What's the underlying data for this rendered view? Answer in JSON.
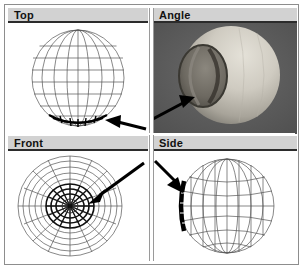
{
  "window": {
    "title": "3D Modeler Four-View Layout",
    "background_color": "#ffffff",
    "frame_color": "#8d8d8d"
  },
  "viewports": [
    {
      "id": "top",
      "label": "Top",
      "position": "top-left",
      "render_mode": "wireframe",
      "object": "sphere",
      "background_color": "#ffffff",
      "wire_color": "#555555",
      "highlight_color": "#000000",
      "highlight_description": "bold dark polar cap at bottom of sphere",
      "annotation": {
        "type": "arrow",
        "direction": "points-left",
        "from": "right",
        "target": "bottom-cap-of-sphere",
        "color": "#000000"
      }
    },
    {
      "id": "angle",
      "label": "Angle",
      "position": "top-right",
      "render_mode": "shaded",
      "object": "sphere-with-crater",
      "background_color": "#5a5a5a",
      "sphere_color": "#c9c6bd",
      "crater_color": "#6e6a63",
      "annotation": {
        "type": "arrow",
        "direction": "points-upper-right",
        "from": "lower-left",
        "target": "crater-rim",
        "color": "#000000"
      }
    },
    {
      "id": "front",
      "label": "Front",
      "position": "bottom-left",
      "render_mode": "wireframe",
      "object": "sphere-polar-view",
      "background_color": "#ffffff",
      "wire_color": "#555555",
      "highlight_color": "#000000",
      "highlight_description": "dense dark concentric rings and radial spokes at center",
      "annotation": {
        "type": "arrow",
        "direction": "points-lower-left",
        "from": "upper-right",
        "target": "center-hub",
        "color": "#000000"
      }
    },
    {
      "id": "side",
      "label": "Side",
      "position": "bottom-right",
      "render_mode": "wireframe",
      "object": "sphere",
      "background_color": "#ffffff",
      "wire_color": "#555555",
      "highlight_color": "#000000",
      "highlight_description": "bold black arc on left limb of sphere",
      "annotation": {
        "type": "arrow",
        "direction": "points-lower-right",
        "from": "upper-left",
        "target": "left-limb-arc",
        "color": "#000000"
      }
    }
  ]
}
